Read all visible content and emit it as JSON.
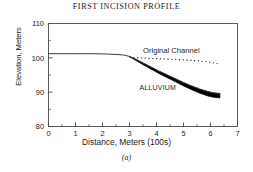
{
  "chart_data": {
    "type": "line",
    "title": "FIRST INCISION PROFILE",
    "subcaption": "(a)",
    "xlabel": "Distance, Meters (100s)",
    "ylabel": "Elevation, Meters",
    "xlim": [
      0,
      7
    ],
    "ylim": [
      80,
      110
    ],
    "xticks": [
      "0",
      "1",
      "2",
      "3",
      "4",
      "5",
      "6",
      "7"
    ],
    "xtick_values": [
      0,
      1,
      2,
      3,
      4,
      5,
      6,
      7
    ],
    "yticks": [
      "80",
      "90",
      "100",
      "110"
    ],
    "ytick_values": [
      80,
      90,
      100,
      110
    ],
    "minor_ticks": true,
    "grid": false,
    "legend_position": "none",
    "annotations": [
      {
        "name": "original-channel",
        "text": "Original Channel",
        "x": 4.55,
        "y": 101.3
      },
      {
        "name": "alluvium",
        "text": "ALLUVIUM",
        "x": 4.05,
        "y": 90.6
      }
    ],
    "series": [
      {
        "name": "Incised bed surface (top of alluvium)",
        "style": "solid-thin-then-thick-band-top",
        "x": [
          0.0,
          0.5,
          1.0,
          1.5,
          2.0,
          2.5,
          2.8,
          3.0,
          3.2,
          3.5,
          3.8,
          4.1,
          4.4,
          4.7,
          5.0,
          5.3,
          5.6,
          5.9,
          6.1,
          6.35
        ],
        "y": [
          101.2,
          101.2,
          101.2,
          101.2,
          101.15,
          101.0,
          100.8,
          100.4,
          99.7,
          98.5,
          97.3,
          96.1,
          95.0,
          93.9,
          92.8,
          91.8,
          90.9,
          90.2,
          89.8,
          89.6
        ]
      },
      {
        "name": "Base of alluvium (bottom of band)",
        "style": "thick-band-bottom",
        "x": [
          3.0,
          3.2,
          3.5,
          3.8,
          4.1,
          4.4,
          4.7,
          5.0,
          5.3,
          5.6,
          5.9,
          6.1,
          6.35
        ],
        "y": [
          100.3,
          99.4,
          98.0,
          96.7,
          95.4,
          94.2,
          93.0,
          91.8,
          90.7,
          89.7,
          88.9,
          88.5,
          88.3
        ]
      },
      {
        "name": "Original Channel",
        "style": "dotted",
        "x": [
          3.0,
          3.3,
          3.6,
          3.9,
          4.2,
          4.5,
          4.8,
          5.1,
          5.4,
          5.7,
          6.0,
          6.2,
          6.35
        ],
        "y": [
          100.2,
          100.0,
          99.9,
          99.8,
          99.7,
          99.6,
          99.5,
          99.35,
          99.2,
          99.0,
          98.7,
          98.4,
          98.1
        ]
      }
    ]
  }
}
